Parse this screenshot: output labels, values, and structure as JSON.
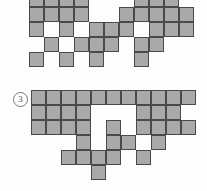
{
  "page": {
    "kind": "polyomino-shape-puzzle",
    "background_color": "#fdfdfd"
  },
  "style": {
    "cell_fill": "#a9a9a9",
    "cell_stroke": "#4a4a4a",
    "label_color": "#555555",
    "cell_size": 15
  },
  "figures": [
    {
      "name": "figure-top",
      "label": "",
      "origin_x": 29,
      "origin_y": -8,
      "cols": 12,
      "rows": 6,
      "cells": [
        [
          0,
          0
        ],
        [
          1,
          0
        ],
        [
          2,
          0
        ],
        [
          3,
          0
        ],
        [
          7,
          0
        ],
        [
          8,
          0
        ],
        [
          9,
          0
        ],
        [
          0,
          1
        ],
        [
          1,
          1
        ],
        [
          2,
          1
        ],
        [
          3,
          1
        ],
        [
          6,
          1
        ],
        [
          7,
          1
        ],
        [
          8,
          1
        ],
        [
          9,
          1
        ],
        [
          10,
          1
        ],
        [
          0,
          2
        ],
        [
          2,
          2
        ],
        [
          4,
          2
        ],
        [
          5,
          2
        ],
        [
          6,
          2
        ],
        [
          8,
          2
        ],
        [
          9,
          2
        ],
        [
          10,
          2
        ],
        [
          1,
          3
        ],
        [
          3,
          3
        ],
        [
          4,
          3
        ],
        [
          5,
          3
        ],
        [
          7,
          3
        ],
        [
          8,
          3
        ],
        [
          0,
          4
        ],
        [
          2,
          4
        ],
        [
          4,
          4
        ],
        [
          7,
          4
        ]
      ]
    },
    {
      "name": "figure-bottom",
      "label": "③",
      "label_text": "3",
      "origin_x": 31,
      "origin_y": 90,
      "cols": 12,
      "rows": 6,
      "cells": [
        [
          0,
          0
        ],
        [
          1,
          0
        ],
        [
          2,
          0
        ],
        [
          3,
          0
        ],
        [
          4,
          0
        ],
        [
          5,
          0
        ],
        [
          6,
          0
        ],
        [
          7,
          0
        ],
        [
          8,
          0
        ],
        [
          9,
          0
        ],
        [
          10,
          0
        ],
        [
          0,
          1
        ],
        [
          1,
          1
        ],
        [
          2,
          1
        ],
        [
          3,
          1
        ],
        [
          7,
          1
        ],
        [
          8,
          1
        ],
        [
          9,
          1
        ],
        [
          0,
          2
        ],
        [
          1,
          2
        ],
        [
          2,
          2
        ],
        [
          3,
          2
        ],
        [
          5,
          2
        ],
        [
          7,
          2
        ],
        [
          8,
          2
        ],
        [
          9,
          2
        ],
        [
          10,
          2
        ],
        [
          3,
          3
        ],
        [
          5,
          3
        ],
        [
          6,
          3
        ],
        [
          8,
          3
        ],
        [
          2,
          4
        ],
        [
          4,
          4
        ],
        [
          5,
          4
        ],
        [
          7,
          4
        ],
        [
          3,
          4
        ],
        [
          4,
          5
        ]
      ]
    }
  ]
}
